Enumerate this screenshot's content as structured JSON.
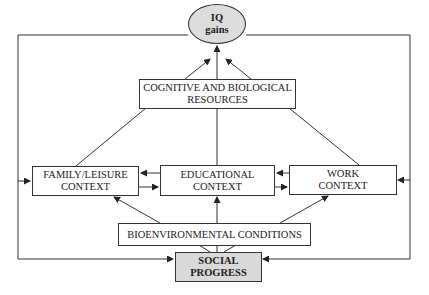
{
  "diagram": {
    "nodes": {
      "iq_gains": {
        "line1": "IQ",
        "line2": "gains",
        "fill": "#dcdcdc",
        "shape": "ellipse"
      },
      "cognitive": {
        "line1": "COGNITIVE AND BIOLOGICAL",
        "line2": "RESOURCES"
      },
      "family": {
        "line1": "FAMILY/LEISURE",
        "line2": "CONTEXT"
      },
      "educational": {
        "line1": "EDUCATIONAL",
        "line2": "CONTEXT"
      },
      "work": {
        "line1": "WORK",
        "line2": "CONTEXT"
      },
      "bioenvironmental": {
        "line1": "BIOENVIRONMENTAL CONDITIONS"
      },
      "social_progress": {
        "line1": "SOCIAL",
        "line2": "PROGRESS",
        "fill": "#d9d9d9"
      }
    },
    "edges": [
      {
        "from": "cognitive",
        "to": "iq_gains"
      },
      {
        "from": "family",
        "to": "iq_gains"
      },
      {
        "from": "educational",
        "to": "iq_gains"
      },
      {
        "from": "work",
        "to": "iq_gains"
      },
      {
        "from": "educational",
        "to": "family"
      },
      {
        "from": "family",
        "to": "educational"
      },
      {
        "from": "work",
        "to": "educational"
      },
      {
        "from": "educational",
        "to": "work"
      },
      {
        "from": "bioenvironmental",
        "to": "family"
      },
      {
        "from": "bioenvironmental",
        "to": "educational"
      },
      {
        "from": "bioenvironmental",
        "to": "work"
      },
      {
        "from": "social_progress",
        "to": "bioenvironmental"
      },
      {
        "from": "iq_gains",
        "to": "social_progress",
        "via": "left-loop"
      },
      {
        "from": "iq_gains",
        "to": "social_progress",
        "via": "right-loop"
      },
      {
        "from": "outer-left-loop",
        "to": "family"
      },
      {
        "from": "outer-right-loop",
        "to": "work"
      }
    ]
  }
}
